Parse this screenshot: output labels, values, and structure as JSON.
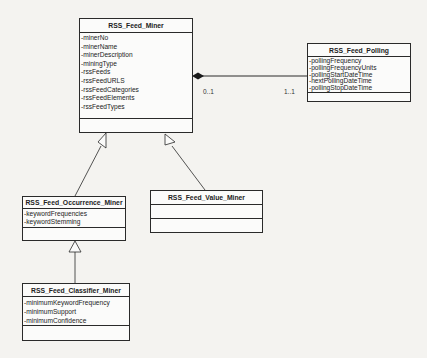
{
  "diagram": {
    "type": "UML class diagram",
    "classes": [
      {
        "id": "miner",
        "name": "RSS_Feed_Miner",
        "attributes": [
          "-minerNo",
          "-minerName",
          "-minerDescription",
          "-miningType",
          "-rssFeeds",
          "-rssFeedURLS",
          "-rssFeedCategories",
          "-rssFeedElements",
          "-rssFeedTypes"
        ],
        "methods": []
      },
      {
        "id": "polling",
        "name": "RSS_Feed_Polling",
        "attributes": [
          "-pollingFrequency",
          "-pollingFrequencyUnits",
          "-pollingStartDateTime",
          "-nextPollingDateTime",
          "-pollingStopDateTime"
        ],
        "methods": []
      },
      {
        "id": "occurrence",
        "name": "RSS_Feed_Occurrence_Miner",
        "attributes": [
          "-keywordFrequencies",
          "-keywordStemming"
        ],
        "methods": []
      },
      {
        "id": "value",
        "name": "RSS_Feed_Value_Miner",
        "attributes": [],
        "methods": []
      },
      {
        "id": "classifier",
        "name": "RSS_Feed_Classifier_Miner",
        "attributes": [
          "-minimumKeywordFrequency",
          "-minimumSupport",
          "-minimumConfidence"
        ],
        "methods": []
      }
    ],
    "relationships": [
      {
        "type": "composition",
        "from": "RSS_Feed_Miner",
        "to": "RSS_Feed_Polling",
        "source_multiplicity": "0..1",
        "target_multiplicity": "1..1"
      },
      {
        "type": "generalization",
        "child": "RSS_Feed_Occurrence_Miner",
        "parent": "RSS_Feed_Miner"
      },
      {
        "type": "generalization",
        "child": "RSS_Feed_Value_Miner",
        "parent": "RSS_Feed_Miner"
      },
      {
        "type": "generalization",
        "child": "RSS_Feed_Classifier_Miner",
        "parent": "RSS_Feed_Occurrence_Miner"
      }
    ]
  },
  "colors": {
    "line": "#2a2a2a",
    "box_fill": "#fbfbfa",
    "background": "#f4f3f0"
  }
}
